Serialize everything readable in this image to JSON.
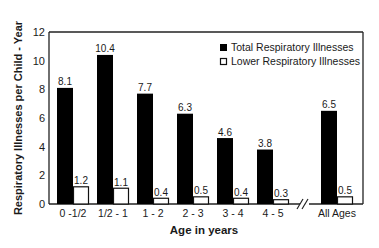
{
  "chart_data": {
    "type": "bar",
    "title": "",
    "xlabel": "Age in years",
    "ylabel": "Respiratory Illnesses per Child - Year",
    "ylim": [
      0,
      12
    ],
    "yticks": [
      0,
      2,
      4,
      6,
      8,
      10,
      12
    ],
    "grid": false,
    "legend_position": "upper right",
    "categories": [
      "0 -1/2",
      "1/2 - 1",
      "1 - 2",
      "2 - 3",
      "3 - 4",
      "4 - 5",
      "All Ages"
    ],
    "axis_break_before": "All Ages",
    "series": [
      {
        "name": "Total Respiratory Illnesses",
        "color": "#000000",
        "values": [
          8.1,
          10.4,
          7.7,
          6.3,
          4.6,
          3.8,
          6.5
        ]
      },
      {
        "name": "Lower Respiratory Illnesses",
        "color": "#ffffff",
        "values": [
          1.2,
          1.1,
          0.4,
          0.5,
          0.4,
          0.3,
          0.5
        ]
      }
    ],
    "data_labels": {
      "Total Respiratory Illnesses": [
        "8.1",
        "10.4",
        "7.7",
        "6.3",
        "4.6",
        "3.8",
        "6.5"
      ],
      "Lower Respiratory Illnesses": [
        "1.2",
        "1.1",
        "0.4",
        "0.5",
        "0.4",
        "0.3",
        "0.5"
      ]
    }
  },
  "legend": {
    "items": [
      {
        "label": "Total Respiratory Illnesses",
        "swatch": "filled"
      },
      {
        "label": "Lower Respiratory Illnesses",
        "swatch": "outline"
      }
    ]
  },
  "axis": {
    "x_label": "Age in years",
    "y_label": "Respiratory Illnesses per Child - Year",
    "break_mark": "//"
  }
}
